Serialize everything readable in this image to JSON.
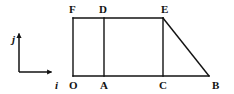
{
  "figure": {
    "type": "geometry-diagram",
    "stroke_color": "#121212",
    "background_color": "#ffffff",
    "stroke_width": 1.4,
    "axes": {
      "origin": {
        "x": 19,
        "y": 72
      },
      "i_axis": {
        "label": "i",
        "label_x": 55,
        "label_y": 80,
        "from_x": 19,
        "from_y": 72,
        "to_x": 53,
        "to_y": 72
      },
      "j_axis": {
        "label": "j",
        "label_x": 12,
        "label_y": 34,
        "from_x": 19,
        "from_y": 72,
        "to_x": 19,
        "to_y": 32
      }
    },
    "vertices": [
      {
        "name": "O",
        "x": 73,
        "y": 76,
        "label_x": 69,
        "label_y": 80
      },
      {
        "name": "A",
        "x": 104,
        "y": 76,
        "label_x": 100,
        "label_y": 80
      },
      {
        "name": "C",
        "x": 163,
        "y": 76,
        "label_x": 159,
        "label_y": 80
      },
      {
        "name": "B",
        "x": 209,
        "y": 76,
        "label_x": 212,
        "label_y": 80
      },
      {
        "name": "F",
        "x": 73,
        "y": 18,
        "label_x": 69,
        "label_y": 4
      },
      {
        "name": "D",
        "x": 104,
        "y": 18,
        "label_x": 99,
        "label_y": 4
      },
      {
        "name": "E",
        "x": 163,
        "y": 18,
        "label_x": 161,
        "label_y": 4
      }
    ],
    "segments": [
      {
        "name": "OF",
        "x1": 73,
        "y1": 76,
        "x2": 73,
        "y2": 18
      },
      {
        "name": "FE",
        "x1": 73,
        "y1": 18,
        "x2": 163,
        "y2": 18
      },
      {
        "name": "EB",
        "x1": 163,
        "y1": 18,
        "x2": 209,
        "y2": 76
      },
      {
        "name": "BO",
        "x1": 209,
        "y1": 76,
        "x2": 73,
        "y2": 76
      },
      {
        "name": "AD",
        "x1": 104,
        "y1": 76,
        "x2": 104,
        "y2": 18
      },
      {
        "name": "CE",
        "x1": 163,
        "y1": 76,
        "x2": 163,
        "y2": 18
      }
    ]
  }
}
